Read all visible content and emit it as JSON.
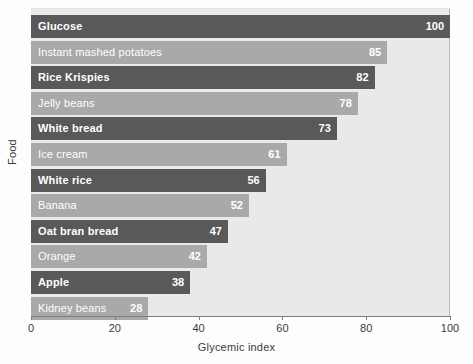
{
  "chart_data": {
    "type": "bar",
    "orientation": "horizontal",
    "title": "",
    "xlabel": "Glycemic index",
    "ylabel": "Food",
    "xlim": [
      0,
      100
    ],
    "xticks": [
      0,
      20,
      40,
      60,
      80,
      100
    ],
    "grid": false,
    "legend": null,
    "categories": [
      "Glucose",
      "Instant mashed potatoes",
      "Rice Krispies",
      "Jelly beans",
      "White bread",
      "Ice cream",
      "White rice",
      "Banana",
      "Oat bran bread",
      "Orange",
      "Apple",
      "Kidney beans"
    ],
    "values": [
      100,
      85,
      82,
      78,
      73,
      61,
      56,
      52,
      47,
      42,
      38,
      28
    ],
    "value_labels": [
      "100",
      "85",
      "82",
      "78",
      "73",
      "61",
      "56",
      "52",
      "47",
      "42",
      "38",
      "28"
    ],
    "bar_colors": [
      "#595959",
      "#a9a9a9",
      "#595959",
      "#a9a9a9",
      "#595959",
      "#a9a9a9",
      "#595959",
      "#a9a9a9",
      "#595959",
      "#a9a9a9",
      "#595959",
      "#a9a9a9"
    ],
    "label_color": "#ffffff",
    "plot_background": "#e9e9e9",
    "figure_background": "#fdfdfd",
    "axis_color": "#7d7d7d"
  }
}
